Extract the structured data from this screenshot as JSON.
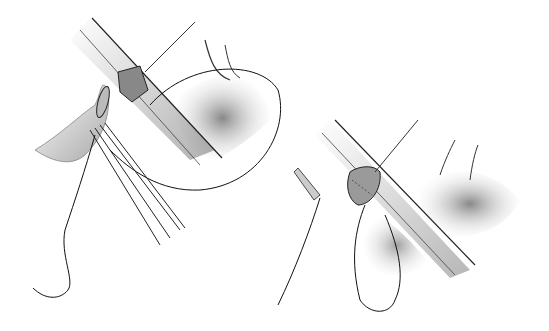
{
  "figure": {
    "type": "surgical illustration",
    "panels": [
      {
        "id": "left",
        "description": "vessel incision with suture loop and forceps holding graft"
      },
      {
        "id": "right",
        "description": "anastomosis in progress with running sutures"
      }
    ],
    "colors": {
      "background": "#ffffff",
      "ink": "#1a1a1a",
      "shade": "#8a8a8a"
    }
  }
}
